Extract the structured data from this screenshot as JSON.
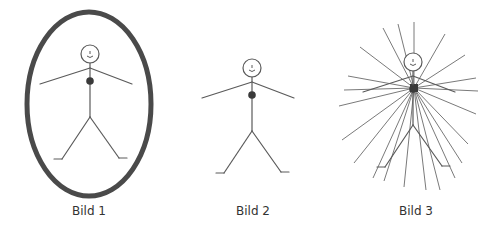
{
  "figures": [
    {
      "id": "bild-1",
      "caption": "Bild 1",
      "variant": "enclosed-in-oval"
    },
    {
      "id": "bild-2",
      "caption": "Bild 2",
      "variant": "plain"
    },
    {
      "id": "bild-3",
      "caption": "Bild 3",
      "variant": "radiating-lines",
      "ray_count": 22
    }
  ],
  "colors": {
    "oval_stroke": "#4a4a4a",
    "figure_stroke": "#5a5a5a",
    "heart_fill": "#3a3a3a",
    "ray_stroke": "#7a7a7a",
    "caption_text": "#333333",
    "background": "#ffffff"
  }
}
